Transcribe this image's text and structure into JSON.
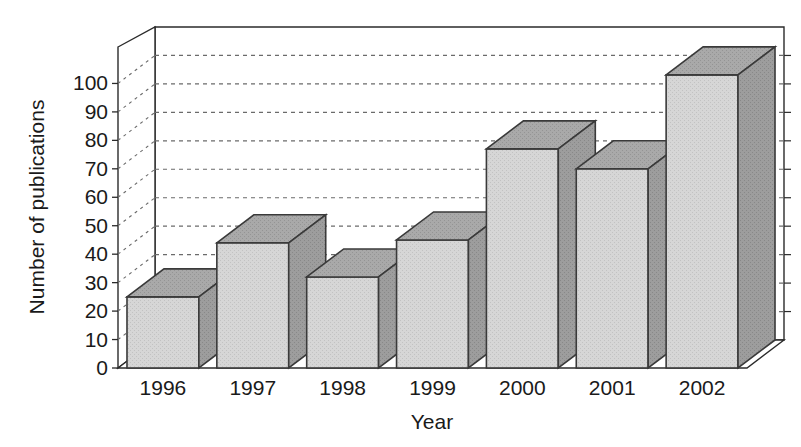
{
  "chart_data": {
    "type": "bar",
    "title": "",
    "subtitle": "",
    "xlabel": "Year",
    "ylabel": "Number of publications",
    "categories": [
      "1996",
      "1997",
      "1998",
      "1999",
      "2000",
      "2001",
      "2002"
    ],
    "values": [
      25,
      44,
      32,
      45,
      77,
      70,
      103
    ],
    "ylim": [
      0,
      110
    ],
    "yticks": [
      "0",
      "10",
      "20",
      "30",
      "40",
      "50",
      "60",
      "70",
      "80",
      "90",
      "100"
    ],
    "ytick_values": [
      0,
      10,
      20,
      30,
      40,
      50,
      60,
      70,
      80,
      90,
      100
    ],
    "grid": true,
    "grid_style": "dashed-horizontal",
    "legend": "none",
    "legend_position": "none",
    "rendering": "3d-isometric",
    "colors": {
      "bar_front": "#d4d4d4",
      "bar_top": "#a8a8a8",
      "bar_side": "#9a9a9a",
      "bar_edge": "#3a3a3a",
      "axis": "#2b2b2b",
      "grid": "#6b6b6b",
      "background": "#ffffff",
      "text": "#1a1a1a"
    }
  }
}
